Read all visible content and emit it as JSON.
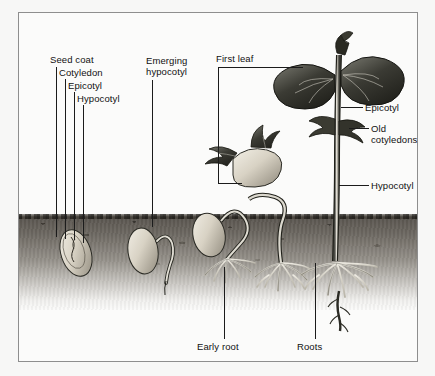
{
  "figure": {
    "frame_border_color": "#8e8e8e",
    "background_color": "#f7f7f6",
    "ink_color": "#1b1b1b"
  },
  "labels": {
    "seed_coat": "Seed coat",
    "cotyledon": "Cotyledon",
    "epicotyl_left": "Epicotyl",
    "hypocotyl_left": "Hypocotyl",
    "emerging_hypocotyl_line1": "Emerging",
    "emerging_hypocotyl_line2": "hypocotyl",
    "first_leaf": "First leaf",
    "epicotyl_right": "Epicotyl",
    "old_cotyledons_line1": "Old",
    "old_cotyledons_line2": "cotyledons",
    "hypocotyl_right": "Hypocotyl",
    "early_root": "Early root",
    "roots": "Roots"
  },
  "stages": [
    {
      "name": "stage-1-dormant-seed",
      "description": "buried seed showing seed coat, cotyledon, epicotyl and hypocotyl"
    },
    {
      "name": "stage-2-emerging-hypocotyl",
      "description": "seed with hypocotyl hook pushing downward root"
    },
    {
      "name": "stage-3-early-root",
      "description": "seedling with early root system and arching hypocotyl"
    },
    {
      "name": "stage-4-cotyledons-above-ground",
      "description": "cotyledons lifted above soil with expanding leaves"
    },
    {
      "name": "stage-5-mature-seedling",
      "description": "seedling with first leaves, epicotyl, old cotyledons and full root system"
    }
  ]
}
